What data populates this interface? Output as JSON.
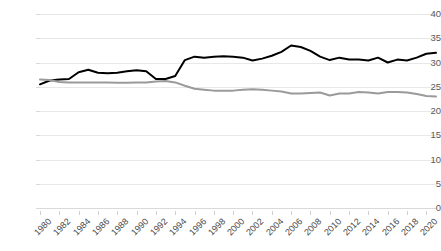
{
  "chart_data": {
    "type": "line",
    "title": "",
    "subtitle": "",
    "xlabel": "",
    "ylabel": "",
    "ylim": [
      0,
      40
    ],
    "ytick_step": 5,
    "yticks": [
      0,
      5,
      10,
      15,
      20,
      25,
      30,
      35,
      40
    ],
    "grid": true,
    "legend": "none",
    "xlim": [
      1980,
      2021
    ],
    "xtick_labels": [
      "1980",
      "1982",
      "1984",
      "1986",
      "1988",
      "1990",
      "1992",
      "1994",
      "1996",
      "1998",
      "2000",
      "2002",
      "2004",
      "2006",
      "2008",
      "2010",
      "2012",
      "2014",
      "2016",
      "2018",
      "2020"
    ],
    "xtick_label_rotation": -45,
    "x": [
      1980,
      1981,
      1982,
      1983,
      1984,
      1985,
      1986,
      1987,
      1988,
      1989,
      1990,
      1991,
      1992,
      1993,
      1994,
      1995,
      1996,
      1997,
      1998,
      1999,
      2000,
      2001,
      2002,
      2003,
      2004,
      2005,
      2006,
      2007,
      2008,
      2009,
      2010,
      2011,
      2012,
      2013,
      2014,
      2015,
      2016,
      2017,
      2018,
      2019,
      2020,
      2021
    ],
    "series": [
      {
        "name": "series-black",
        "color": "#000000",
        "values": [
          25.5,
          26.3,
          26.5,
          26.6,
          28.0,
          28.5,
          27.9,
          27.8,
          27.9,
          28.2,
          28.4,
          28.2,
          26.6,
          26.6,
          27.2,
          30.5,
          31.2,
          31.0,
          31.2,
          31.3,
          31.2,
          31.0,
          30.4,
          30.8,
          31.4,
          32.2,
          33.5,
          33.2,
          32.4,
          31.2,
          30.5,
          31.0,
          30.6,
          30.6,
          30.4,
          31.0,
          30.0,
          30.6,
          30.4,
          31.0,
          31.8,
          32.0
        ]
      },
      {
        "name": "series-gray",
        "color": "#9a9a9a",
        "values": [
          26.5,
          26.4,
          26.0,
          25.9,
          25.9,
          25.9,
          25.9,
          25.9,
          25.8,
          25.8,
          25.9,
          25.9,
          26.1,
          26.2,
          25.9,
          25.2,
          24.6,
          24.4,
          24.2,
          24.2,
          24.2,
          24.4,
          24.5,
          24.4,
          24.2,
          24.0,
          23.6,
          23.6,
          23.7,
          23.8,
          23.2,
          23.6,
          23.6,
          23.9,
          23.8,
          23.6,
          23.9,
          23.9,
          23.8,
          23.5,
          23.1,
          23.0
        ]
      }
    ]
  }
}
